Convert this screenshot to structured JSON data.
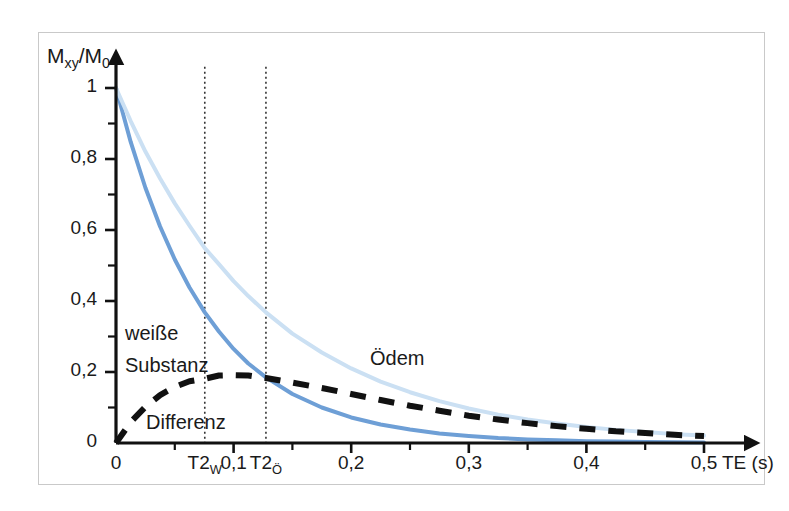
{
  "figure": {
    "background_color": "#ffffff",
    "frame_color": "#c9c9c9"
  },
  "axes": {
    "y_title_main": "M",
    "y_title_sub1": "xy",
    "y_title_slash": "/M",
    "y_title_sub2": "0",
    "x_unit_label": "TE (s)"
  },
  "chart_data": {
    "type": "line",
    "title": "",
    "xlabel": "TE (s)",
    "ylabel": "Mxy/M0",
    "xlim": [
      0,
      0.52
    ],
    "ylim": [
      0,
      1.06
    ],
    "grid": false,
    "legend": "inline-annotations",
    "x_ticks": [
      {
        "value": 0,
        "label": "0"
      },
      {
        "value": 0.1,
        "label": "0,1"
      },
      {
        "value": 0.2,
        "label": "0,2"
      },
      {
        "value": 0.3,
        "label": "0,3"
      },
      {
        "value": 0.4,
        "label": "0,4"
      },
      {
        "value": 0.5,
        "label": "0,5"
      }
    ],
    "x_minor_ticks": [
      0.05,
      0.15,
      0.25,
      0.35,
      0.45
    ],
    "y_ticks": [
      {
        "value": 0,
        "label": "0"
      },
      {
        "value": 0.2,
        "label": "0,2"
      },
      {
        "value": 0.4,
        "label": "0,4"
      },
      {
        "value": 0.6,
        "label": "0,6"
      },
      {
        "value": 0.8,
        "label": "0,8"
      },
      {
        "value": 1,
        "label": "1"
      }
    ],
    "y_minor_ticks": [
      0.1,
      0.3,
      0.5,
      0.7,
      0.9
    ],
    "markers": [
      {
        "name": "T2_W",
        "label_main": "T2",
        "label_sub": "W",
        "x": 0.0755,
        "color": "#333333",
        "style": "dotted-vertical"
      },
      {
        "name": "T2_O",
        "label_main": "T2",
        "label_sub": "Ö",
        "x": 0.1275,
        "color": "#333333",
        "style": "dotted-vertical"
      }
    ],
    "series": [
      {
        "name": "weisse-substanz",
        "label_line1": "weiße",
        "label_line2": "Substanz",
        "color": "#6e9fd6",
        "style": "solid",
        "width": 4,
        "decay_constant_T2": 0.0755,
        "x": [
          0,
          0.0125,
          0.025,
          0.0375,
          0.05,
          0.0625,
          0.0755,
          0.0875,
          0.1,
          0.1125,
          0.1275,
          0.15,
          0.175,
          0.2,
          0.225,
          0.25,
          0.275,
          0.3,
          0.325,
          0.35,
          0.375,
          0.4,
          0.425,
          0.45,
          0.475,
          0.5
        ],
        "y": [
          1.0,
          0.848,
          0.719,
          0.61,
          0.517,
          0.438,
          0.368,
          0.314,
          0.265,
          0.224,
          0.185,
          0.138,
          0.1,
          0.072,
          0.052,
          0.038,
          0.027,
          0.02,
          0.014,
          0.01,
          0.0075,
          0.005,
          0.004,
          0.003,
          0.002,
          0.0015
        ]
      },
      {
        "name": "oedem",
        "label": "Ödem",
        "color": "#cbe0f3",
        "style": "solid",
        "width": 4,
        "decay_constant_T2": 0.1275,
        "x": [
          0,
          0.0125,
          0.025,
          0.0375,
          0.05,
          0.0625,
          0.0755,
          0.0875,
          0.1,
          0.1125,
          0.1275,
          0.15,
          0.175,
          0.2,
          0.225,
          0.25,
          0.275,
          0.3,
          0.325,
          0.35,
          0.375,
          0.4,
          0.425,
          0.45,
          0.475,
          0.5
        ],
        "y": [
          1.0,
          0.907,
          0.821,
          0.745,
          0.675,
          0.612,
          0.549,
          0.504,
          0.456,
          0.414,
          0.368,
          0.308,
          0.255,
          0.21,
          0.173,
          0.143,
          0.118,
          0.097,
          0.08,
          0.066,
          0.055,
          0.045,
          0.037,
          0.031,
          0.025,
          0.021
        ]
      },
      {
        "name": "differenz",
        "label": "Differenz",
        "color": "#111111",
        "style": "dashed",
        "width": 6,
        "dash_pattern": "16,13",
        "x": [
          0,
          0.0125,
          0.025,
          0.0375,
          0.05,
          0.0625,
          0.0755,
          0.0875,
          0.1,
          0.1125,
          0.1275,
          0.15,
          0.175,
          0.2,
          0.225,
          0.25,
          0.275,
          0.3,
          0.325,
          0.35,
          0.375,
          0.4,
          0.425,
          0.45,
          0.475,
          0.5
        ],
        "y": [
          0.0,
          0.059,
          0.102,
          0.135,
          0.158,
          0.174,
          0.181,
          0.19,
          0.191,
          0.19,
          0.183,
          0.17,
          0.155,
          0.138,
          0.121,
          0.105,
          0.091,
          0.077,
          0.066,
          0.056,
          0.0475,
          0.04,
          0.033,
          0.028,
          0.023,
          0.0195
        ]
      }
    ],
    "annotations": [
      {
        "name": "weisse-substanz-label",
        "text_line1": "weiße",
        "text_line2": "Substanz",
        "x_px": 125,
        "y_px": 317
      },
      {
        "name": "differenz-label",
        "text": "Differenz",
        "x_px": 146,
        "y_px": 411
      },
      {
        "name": "oedem-label",
        "text": "Ödem",
        "x_px": 370,
        "y_px": 347
      }
    ]
  }
}
